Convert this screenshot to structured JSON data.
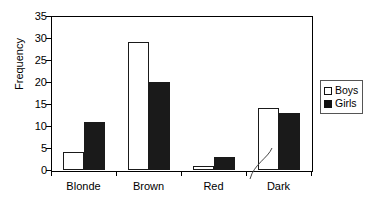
{
  "chart_data": {
    "type": "bar",
    "title": "",
    "xlabel": "",
    "ylabel": "Frequency",
    "categories": [
      "Blonde",
      "Brown",
      "Red",
      "Dark"
    ],
    "series": [
      {
        "name": "Boys",
        "values": [
          4,
          29,
          1,
          14
        ],
        "color": "#ffffff"
      },
      {
        "name": "Girls",
        "values": [
          11,
          20,
          3,
          13
        ],
        "color": "#000000"
      }
    ],
    "ylim": [
      0,
      35
    ],
    "ytick_step": 5,
    "yticks": [
      0,
      5,
      10,
      15,
      20,
      25,
      30,
      35
    ],
    "grid": false,
    "legend_position": "right-outside",
    "annotations": [
      {
        "name": "dark-leader-line",
        "from": "Dark",
        "to": "boys-bar-dark"
      }
    ]
  },
  "legend": {
    "entries": [
      {
        "label": "Boys"
      },
      {
        "label": "Girls"
      }
    ]
  }
}
